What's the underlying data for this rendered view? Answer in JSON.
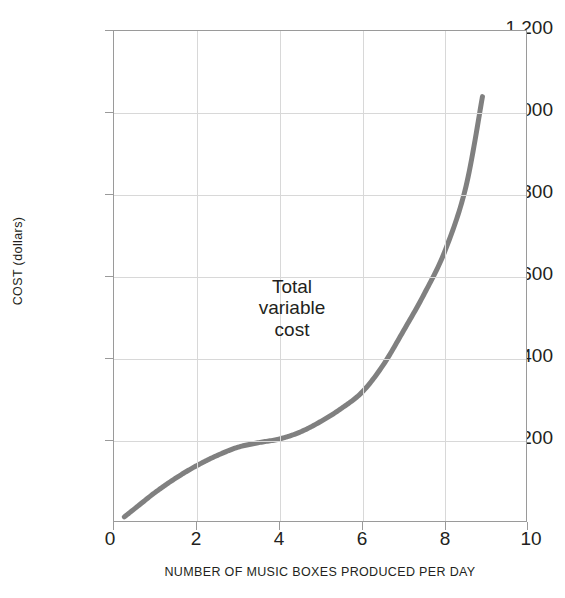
{
  "chart_data": {
    "type": "line",
    "title": "",
    "subtitle": "",
    "xlabel": "NUMBER OF MUSIC BOXES PRODUCED PER DAY",
    "ylabel": "COST (dollars)",
    "xlim": [
      0,
      10
    ],
    "ylim": [
      0,
      1200
    ],
    "grid": true,
    "legend": "none",
    "xticks": [
      0,
      2,
      4,
      6,
      8,
      10
    ],
    "xticklabels": [
      "0",
      "2",
      "4",
      "6",
      "8",
      "10"
    ],
    "yticks": [
      0,
      200,
      400,
      600,
      800,
      1000,
      1200
    ],
    "yticklabels": [
      "0",
      "200",
      "400",
      "600",
      "800",
      "1,000",
      "1,200"
    ],
    "series": [
      {
        "name": "Total variable cost",
        "color": "#808080",
        "x": [
          0.25,
          0.5,
          1.0,
          1.5,
          2.0,
          2.5,
          3.0,
          3.5,
          4.0,
          4.5,
          5.0,
          5.5,
          6.0,
          6.5,
          7.0,
          7.5,
          8.0,
          8.5,
          8.9
        ],
        "y": [
          15,
          35,
          75,
          110,
          140,
          165,
          185,
          196,
          205,
          222,
          248,
          280,
          320,
          385,
          470,
          560,
          665,
          820,
          1040
        ]
      }
    ],
    "annotations": [
      {
        "name": "total-variable-cost-label",
        "lines": [
          "Total",
          "variable",
          "cost"
        ],
        "x": 5.0,
        "y": 440
      }
    ]
  },
  "axes": {
    "y_title": "COST (dollars)",
    "x_title": "NUMBER OF MUSIC BOXES PRODUCED PER DAY"
  },
  "annotation": {
    "line1": "Total",
    "line2": "variable",
    "line3": "cost"
  },
  "yticklabels": {
    "t0": "0",
    "t200": "200",
    "t400": "400",
    "t600": "600",
    "t800": "800",
    "t1000": "1,000",
    "t1200": "1,200"
  },
  "xticklabels": {
    "t0": "0",
    "t2": "2",
    "t4": "4",
    "t6": "6",
    "t8": "8",
    "t10": "10"
  },
  "colors": {
    "curve": "#808080",
    "gridline": "#d8d8d8",
    "axis": "#9a9a9a",
    "text": "#231f20",
    "background": "#ffffff"
  }
}
